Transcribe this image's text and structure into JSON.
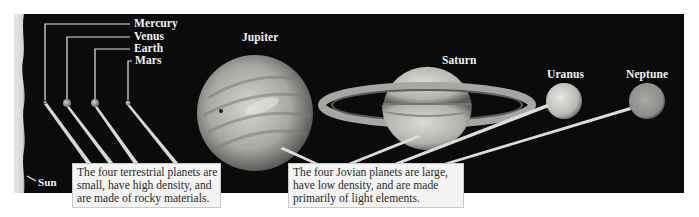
{
  "diagram": {
    "background_color": "#0a0a0a",
    "sun": {
      "label": "Sun"
    },
    "terrestrial": {
      "planets": [
        {
          "name": "Mercury",
          "x": 45,
          "y": 102,
          "r": 1.5
        },
        {
          "name": "Venus",
          "x": 67,
          "y": 103,
          "r": 4
        },
        {
          "name": "Earth",
          "x": 95,
          "y": 103,
          "r": 4
        },
        {
          "name": "Mars",
          "x": 128,
          "y": 103,
          "r": 2.5
        }
      ],
      "caption_lines": [
        "The four terrestrial planets are",
        "small, have high density, and",
        "are made of rocky materials."
      ]
    },
    "jovian": {
      "planets": [
        {
          "name": "Jupiter",
          "x": 255,
          "y": 113,
          "r": 58
        },
        {
          "name": "Saturn",
          "x": 427,
          "y": 105,
          "r": 45
        },
        {
          "name": "Uranus",
          "x": 564,
          "y": 101,
          "r": 18
        },
        {
          "name": "Neptune",
          "x": 647,
          "y": 101,
          "r": 18
        }
      ],
      "caption_lines": [
        "The four Jovian planets are large,",
        "have low density, and are made",
        "primarily of light elements."
      ]
    }
  }
}
